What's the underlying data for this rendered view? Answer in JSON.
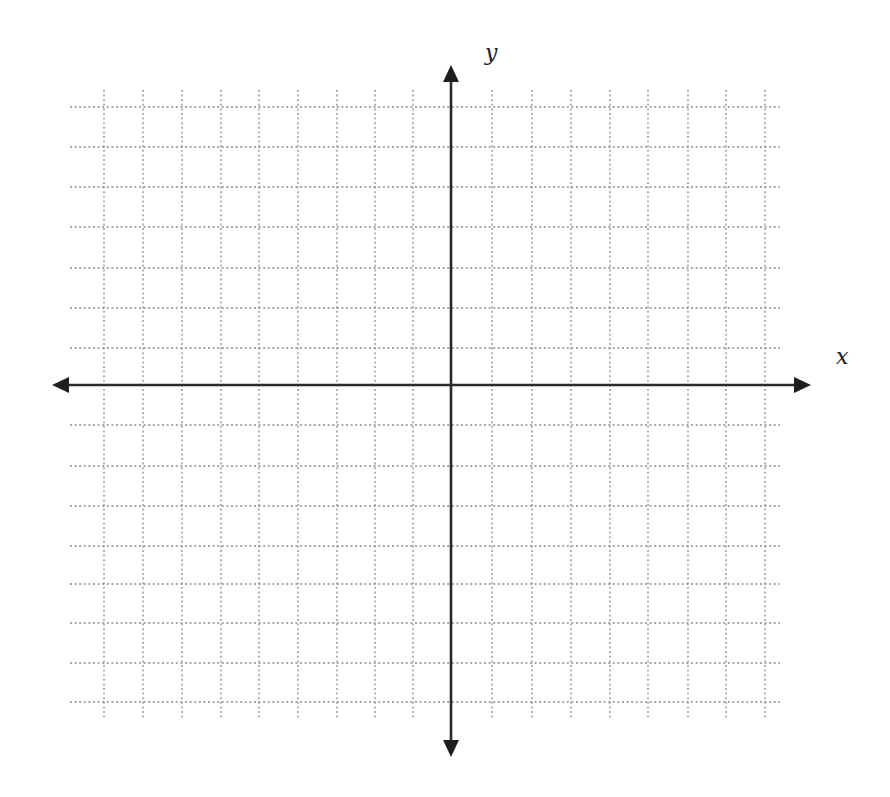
{
  "diagram": {
    "type": "coordinate-plane",
    "labels": {
      "x_axis": "x",
      "y_axis": "y"
    },
    "grid": {
      "style": "dotted",
      "color": "#8c8c8c",
      "vertical_lines_x": [
        104,
        143,
        182,
        221,
        259,
        298,
        337,
        375,
        413,
        451,
        492,
        532,
        571,
        610,
        648,
        688,
        726,
        765
      ],
      "horizontal_lines_y": [
        107,
        147,
        187,
        227,
        268,
        308,
        348,
        385,
        425,
        466,
        506,
        546,
        584,
        623,
        663,
        702
      ],
      "vertical_span": [
        90,
        720
      ],
      "horizontal_span": [
        70,
        780
      ]
    },
    "axes": {
      "color": "#2a2a2a",
      "x_axis": {
        "y": 385,
        "from": 52,
        "to": 811
      },
      "y_axis": {
        "x": 451,
        "from": 65,
        "to": 757
      }
    },
    "label_positions": {
      "x_label": {
        "left": 836,
        "top": 346
      },
      "y_label": {
        "left": 485,
        "top": 42
      }
    }
  }
}
